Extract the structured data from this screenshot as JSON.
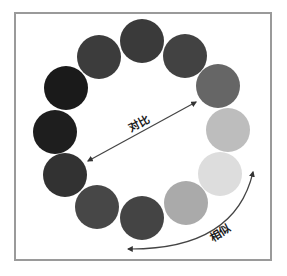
{
  "diagram": {
    "type": "grayscale color wheel",
    "circles": [
      {
        "id": "top",
        "cx": 142,
        "cy": 41,
        "r": 22,
        "color": "#3a3a3a"
      },
      {
        "id": "top-right",
        "cx": 185,
        "cy": 56,
        "r": 22,
        "color": "#424242"
      },
      {
        "id": "right-upper",
        "cx": 218,
        "cy": 86,
        "r": 22,
        "color": "#666666"
      },
      {
        "id": "right",
        "cx": 228,
        "cy": 130,
        "r": 22,
        "color": "#bdbdbd"
      },
      {
        "id": "right-lower",
        "cx": 220,
        "cy": 174,
        "r": 22,
        "color": "#dddddd"
      },
      {
        "id": "bottom-right",
        "cx": 186,
        "cy": 203,
        "r": 22,
        "color": "#aaaaaa"
      },
      {
        "id": "bottom",
        "cx": 142,
        "cy": 218,
        "r": 22,
        "color": "#444444"
      },
      {
        "id": "bottom-left",
        "cx": 97,
        "cy": 207,
        "r": 22,
        "color": "#474747"
      },
      {
        "id": "left-lower",
        "cx": 65,
        "cy": 175,
        "r": 22,
        "color": "#323232"
      },
      {
        "id": "left",
        "cx": 55,
        "cy": 132,
        "r": 22,
        "color": "#1e1e1e"
      },
      {
        "id": "left-upper",
        "cx": 66,
        "cy": 88,
        "r": 22,
        "color": "#1a1a1a"
      },
      {
        "id": "top-left",
        "cx": 99,
        "cy": 57,
        "r": 22,
        "color": "#3c3c3c"
      }
    ],
    "contrast_arrow": {
      "label": "对比",
      "x1": 88,
      "y1": 161,
      "x2": 196,
      "y2": 102
    },
    "similar_arrow": {
      "label": "相似",
      "x1": 128,
      "y1": 249,
      "x2": 253,
      "y2": 172
    },
    "arrow_color": "#444444",
    "frame_color": "#9a9a9a"
  }
}
